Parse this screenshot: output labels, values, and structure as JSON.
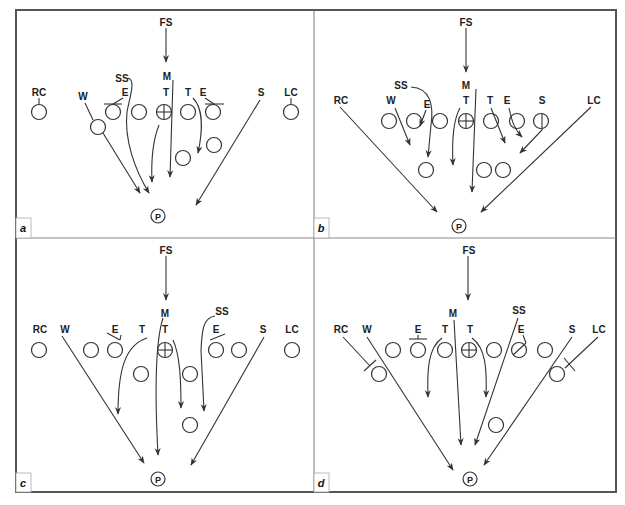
{
  "figure": {
    "panels": [
      {
        "id": "a",
        "tag": "a",
        "labels": {
          "fs": "FS",
          "m": "M",
          "ss": "SS",
          "rc": "RC",
          "w": "W",
          "e1": "E",
          "t1": "T",
          "t2": "T",
          "e2": "E",
          "s": "S",
          "lc": "LC",
          "p": "P"
        }
      },
      {
        "id": "b",
        "tag": "b",
        "labels": {
          "fs": "FS",
          "m": "M",
          "ss": "SS",
          "rc": "RC",
          "w": "W",
          "e1": "E",
          "t1": "T",
          "t2": "T",
          "e2": "E",
          "s": "S",
          "lc": "LC",
          "p": "P"
        }
      },
      {
        "id": "c",
        "tag": "c",
        "labels": {
          "fs": "FS",
          "m": "M",
          "ss": "SS",
          "rc": "RC",
          "w": "W",
          "e1": "E",
          "t1": "T",
          "t2": "T",
          "e2": "E",
          "s": "S",
          "lc": "LC",
          "p": "P"
        }
      },
      {
        "id": "d",
        "tag": "d",
        "labels": {
          "fs": "FS",
          "m": "M",
          "ss": "SS",
          "rc": "RC",
          "w": "W",
          "e1": "E",
          "t1": "T",
          "t2": "T",
          "e2": "E",
          "s": "S",
          "lc": "LC",
          "p": "P"
        }
      }
    ],
    "colors": {
      "line": "#333333",
      "frame": "#555555",
      "background": "#ffffff"
    }
  }
}
